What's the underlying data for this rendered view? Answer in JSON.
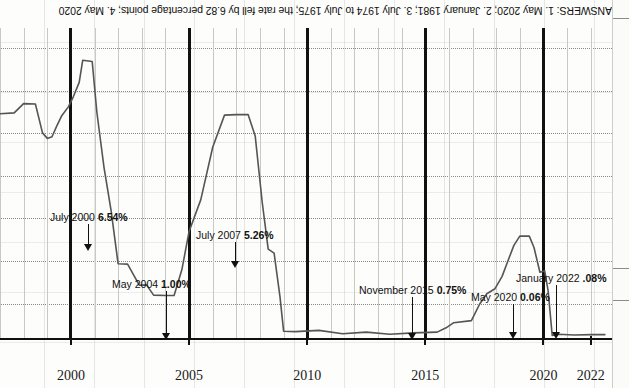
{
  "answers_note": {
    "text": "ANSWERS: 1. May 2020; 2. January 1981; 3. July 1974 to July 1975; the rate fell by 6.82 percentage points; 4. May 2020"
  },
  "chart_data": {
    "type": "line",
    "title": "",
    "xlabel": "",
    "ylabel": "",
    "grid": true,
    "legend": "none",
    "xlim": [
      1997.0,
      2022.9
    ],
    "ylim": [
      0,
      7.3
    ],
    "xticks": [
      "2000",
      "2005",
      "2010",
      "2015",
      "2020",
      "2022"
    ],
    "xtick_values": [
      2000,
      2005,
      2010,
      2015,
      2020,
      2022
    ],
    "series": [
      {
        "name": "Federal funds rate",
        "x": [
          1997.0,
          1997.6,
          1998.0,
          1998.5,
          1998.8,
          1999.0,
          1999.2,
          1999.4,
          1999.6,
          1999.9,
          2000.1,
          2000.35,
          2000.5,
          2000.9,
          2001.1,
          2001.4,
          2001.7,
          2002.0,
          2002.4,
          2002.9,
          2003.2,
          2003.5,
          2004.0,
          2004.37,
          2004.7,
          2005.0,
          2005.5,
          2006.0,
          2006.5,
          2007.0,
          2007.5,
          2007.8,
          2008.1,
          2008.35,
          2008.6,
          2008.85,
          2009.0,
          2009.5,
          2010.5,
          2011.5,
          2012.5,
          2013.5,
          2014.5,
          2015.5,
          2015.88,
          2016.2,
          2016.95,
          2017.3,
          2017.6,
          2017.95,
          2018.25,
          2018.5,
          2018.75,
          2019.0,
          2019.4,
          2019.6,
          2019.85,
          2020.05,
          2020.2,
          2020.37,
          2020.6,
          2021.3,
          2022.05,
          2022.6
        ],
        "y": [
          5.28,
          5.3,
          5.52,
          5.51,
          4.83,
          4.7,
          4.74,
          4.99,
          5.22,
          5.45,
          5.68,
          6.02,
          6.54,
          6.51,
          5.31,
          4.02,
          3.0,
          1.75,
          1.74,
          1.24,
          1.25,
          1.01,
          1.0,
          1.0,
          1.61,
          2.5,
          3.26,
          4.49,
          5.25,
          5.26,
          5.26,
          4.76,
          3.18,
          2.09,
          2.0,
          0.97,
          0.16,
          0.15,
          0.18,
          0.1,
          0.14,
          0.09,
          0.12,
          0.14,
          0.24,
          0.36,
          0.41,
          0.8,
          1.04,
          1.16,
          1.45,
          1.82,
          2.18,
          2.4,
          2.4,
          2.13,
          1.55,
          1.58,
          1.1,
          0.06,
          0.09,
          0.07,
          0.08,
          0.08
        ],
        "color": "#555555"
      }
    ],
    "annotations": [
      {
        "id": "jul2000",
        "label": "July 2000",
        "value": "6.54%",
        "x": 2000.5,
        "y": 6.54
      },
      {
        "id": "may2004",
        "label": "May 2004",
        "value": "1.00%",
        "x": 2004.37,
        "y": 1.0
      },
      {
        "id": "jul2007",
        "label": "July 2007",
        "value": "5.26%",
        "x": 2007.5,
        "y": 5.26
      },
      {
        "id": "nov2015",
        "label": "November 2015",
        "value": "0.75%",
        "x": 2015.88,
        "y": 0.24
      },
      {
        "id": "may2020",
        "label": "May 2020",
        "value": "0.06%",
        "x": 2020.37,
        "y": 0.06
      },
      {
        "id": "jan2022",
        "label": "January 2022",
        "value": ".08%",
        "x": 2022.05,
        "y": 0.08
      }
    ]
  }
}
